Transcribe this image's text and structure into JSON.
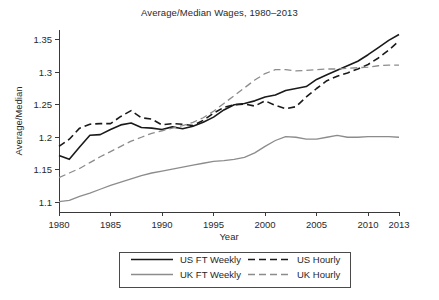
{
  "chart_data": {
    "type": "line",
    "title": "Average/Median Wages, 1980–2013",
    "xlabel": "Year",
    "ylabel": "Average/Median",
    "xlim": [
      1980,
      2013
    ],
    "ylim": [
      1.085,
      1.365
    ],
    "grid": false,
    "legend_position": "below-axes",
    "xticks": [
      1980,
      1985,
      1990,
      1995,
      2000,
      2005,
      2010,
      2013
    ],
    "xtick_labels": [
      "1980",
      "1985",
      "1990",
      "1995",
      "2000",
      "2005",
      "2010",
      "2013"
    ],
    "yticks": [
      1.1,
      1.15,
      1.2,
      1.25,
      1.3,
      1.35
    ],
    "ytick_labels": [
      "1.1",
      "1.15",
      "1.2",
      "1.25",
      "1.3",
      "1.35"
    ],
    "x": [
      1980,
      1981,
      1982,
      1983,
      1984,
      1985,
      1986,
      1987,
      1988,
      1989,
      1990,
      1991,
      1992,
      1993,
      1994,
      1995,
      1996,
      1997,
      1998,
      1999,
      2000,
      2001,
      2002,
      2003,
      2004,
      2005,
      2006,
      2007,
      2008,
      2009,
      2010,
      2011,
      2012,
      2013
    ],
    "series": [
      {
        "name": "US FT Weekly",
        "style": "solid",
        "color": "#1a1a1a",
        "width": 1.6,
        "values": [
          1.172,
          1.166,
          1.185,
          1.203,
          1.204,
          1.212,
          1.219,
          1.222,
          1.215,
          1.214,
          1.212,
          1.216,
          1.213,
          1.217,
          1.223,
          1.231,
          1.242,
          1.25,
          1.252,
          1.256,
          1.262,
          1.265,
          1.272,
          1.275,
          1.278,
          1.289,
          1.296,
          1.303,
          1.31,
          1.317,
          1.327,
          1.338,
          1.349,
          1.358
        ]
      },
      {
        "name": "US Hourly",
        "style": "dashed",
        "color": "#1a1a1a",
        "width": 1.6,
        "values": [
          1.186,
          1.197,
          1.214,
          1.22,
          1.221,
          1.221,
          1.232,
          1.241,
          1.23,
          1.228,
          1.219,
          1.221,
          1.22,
          1.218,
          1.226,
          1.237,
          1.246,
          1.25,
          1.251,
          1.248,
          1.256,
          1.249,
          1.244,
          1.247,
          1.262,
          1.275,
          1.287,
          1.294,
          1.299,
          1.305,
          1.312,
          1.322,
          1.334,
          1.348
        ]
      },
      {
        "name": "UK FT Weekly",
        "style": "solid",
        "color": "#8c8c8c",
        "width": 1.3,
        "values": [
          1.101,
          1.103,
          1.109,
          1.114,
          1.12,
          1.126,
          1.131,
          1.136,
          1.141,
          1.145,
          1.148,
          1.151,
          1.154,
          1.157,
          1.16,
          1.163,
          1.164,
          1.166,
          1.169,
          1.176,
          1.186,
          1.195,
          1.201,
          1.2,
          1.197,
          1.197,
          1.2,
          1.203,
          1.2,
          1.2,
          1.201,
          1.201,
          1.201,
          1.2
        ]
      },
      {
        "name": "UK Hourly",
        "style": "dashed",
        "color": "#8c8c8c",
        "width": 1.3,
        "values": [
          1.138,
          1.145,
          1.152,
          1.161,
          1.17,
          1.178,
          1.186,
          1.194,
          1.2,
          1.206,
          1.21,
          1.214,
          1.218,
          1.223,
          1.23,
          1.24,
          1.252,
          1.264,
          1.276,
          1.288,
          1.298,
          1.304,
          1.304,
          1.302,
          1.303,
          1.304,
          1.305,
          1.305,
          1.306,
          1.307,
          1.308,
          1.31,
          1.311,
          1.311
        ]
      }
    ],
    "legend": [
      {
        "label": "US FT Weekly",
        "style": "solid",
        "color": "#1a1a1a"
      },
      {
        "label": "US Hourly",
        "style": "dashed",
        "color": "#1a1a1a"
      },
      {
        "label": "UK FT Weekly",
        "style": "solid",
        "color": "#8c8c8c"
      },
      {
        "label": "UK Hourly",
        "style": "dashed",
        "color": "#8c8c8c"
      }
    ]
  },
  "caption": {
    "text": ""
  }
}
